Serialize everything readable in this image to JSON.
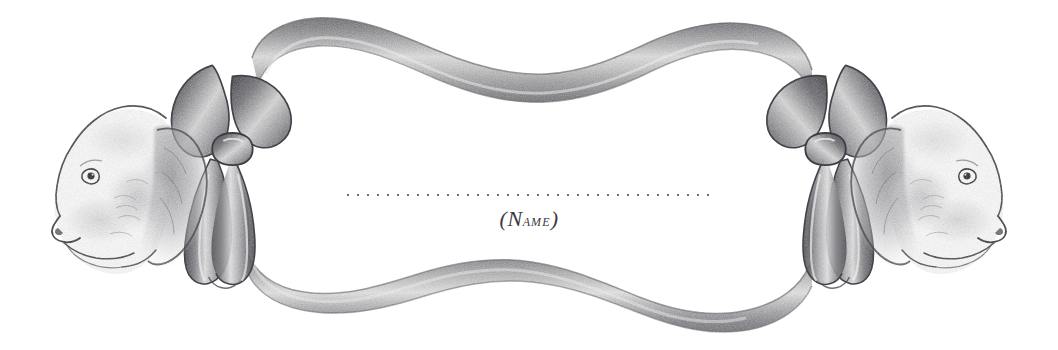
{
  "artwork": {
    "title": "Decorative dog-head ribbon cartouche nameplate",
    "medium": "pencil illustration",
    "background_color": "#ffffff",
    "ink_color": "#4a4a4e",
    "ribbon_light": "#d8d8d8",
    "ribbon_mid": "#9a9a9a",
    "ribbon_dark": "#5f5f63",
    "fur_shadow": "#b4b4b4",
    "canvas": {
      "width": 1058,
      "height": 350
    }
  },
  "nameplate": {
    "rule_label": "dotted writing line",
    "caption_open_paren": "(",
    "caption_initial": "N",
    "caption_rest": "ame",
    "caption_close_paren": ")",
    "caption_full": "(Name)",
    "rule_color": "#6e6e72",
    "caption_color": "#3a3a3e"
  },
  "elements": {
    "left_dog_label": "left dog head facing left",
    "right_dog_label": "right dog head facing right",
    "left_bow_label": "left ribbon bow",
    "right_bow_label": "right ribbon bow",
    "top_ribbon_label": "top wavy ribbon band",
    "bottom_ribbon_label": "bottom wavy ribbon band"
  }
}
